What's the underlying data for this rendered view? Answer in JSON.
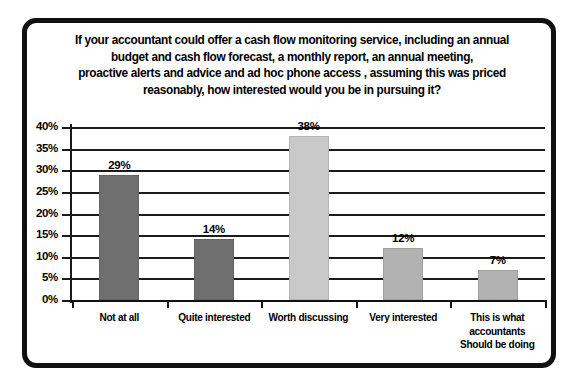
{
  "chart_data": {
    "type": "bar",
    "title_lines": [
      "If your accountant could offer a cash flow monitoring service, including an annual",
      "budget and cash flow forecast, a monthly report, an annual meeting,",
      "proactive alerts and advice and ad hoc phone access , assuming this was priced",
      "reasonably, how interested would you be in pursuing it?"
    ],
    "categories": [
      "Not at all",
      "Quite interested",
      "Worth discussing",
      "Very interested",
      "This is what accountants Should be doing"
    ],
    "category_lines": [
      [
        "Not at all"
      ],
      [
        "Quite interested"
      ],
      [
        "Worth discussing"
      ],
      [
        "Very interested"
      ],
      [
        "This is what",
        "accountants",
        "Should be doing"
      ]
    ],
    "values": [
      29,
      14,
      38,
      12,
      7
    ],
    "data_labels": [
      "29%",
      "14%",
      "38%",
      "12%",
      "7%"
    ],
    "bar_colors": [
      "#6f6f6f",
      "#6f6f6f",
      "#c9c9c9",
      "#b2b2b2",
      "#b2b2b2"
    ],
    "xlabel": "",
    "ylabel": "",
    "ylim": [
      0,
      40
    ],
    "yticks": [
      0,
      5,
      10,
      15,
      20,
      25,
      30,
      35,
      40
    ],
    "ytick_labels": [
      "0%",
      "5%",
      "10%",
      "15%",
      "20%",
      "25%",
      "30%",
      "35%",
      "40%"
    ],
    "grid": true,
    "grid_color": "#1a1a1a",
    "legend": false,
    "background": "#ffffff",
    "frame_color": "#111111"
  }
}
